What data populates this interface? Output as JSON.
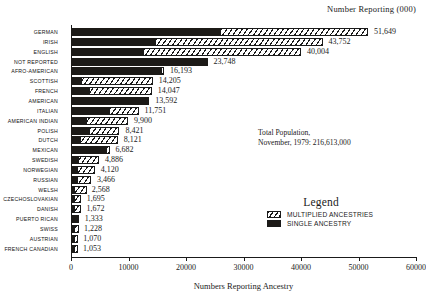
{
  "chart_data": {
    "type": "bar",
    "orientation": "horizontal",
    "stacked": true,
    "title": "Number Reporting (000)",
    "xlabel": "Numbers Reporting Ancestry",
    "ylabel": "",
    "xlim": [
      0,
      60000
    ],
    "xticks": [
      0,
      10000,
      20000,
      30000,
      40000,
      50000,
      60000
    ],
    "xticklabels": [
      "0",
      "10000",
      "20000",
      "30000",
      "40000",
      "50000",
      "60000"
    ],
    "grid": false,
    "legend_position": "lower-right",
    "legend_title": "Legend",
    "annotation": "Total Population,\nNovember, 1979: 216,613,000",
    "annotation_lines": [
      "Total Population,",
      "November, 1979: 216,613,000"
    ],
    "categories": [
      "GERMAN",
      "IRISH",
      "ENGLISH",
      "NOT REPORTED",
      "AFRO-AMERICAN",
      "SCOTTISH",
      "FRENCH",
      "AMERICAN",
      "ITALIAN",
      "AMERICAN INDIAN",
      "POLISH",
      "DUTCH",
      "MEXICAN",
      "SWEDISH",
      "NORWEGIAN",
      "RUSSIAN",
      "WELSH",
      "CZECHOSLOVAKIAN",
      "DANISH",
      "PUERTO RICAN",
      "SWISS",
      "AUSTRIAN",
      "FRENCH CANADIAN"
    ],
    "values": [
      51649,
      43752,
      40004,
      23748,
      16193,
      14205,
      14047,
      13592,
      11751,
      9900,
      8421,
      8121,
      6682,
      4886,
      4120,
      3466,
      2568,
      1695,
      1672,
      1333,
      1228,
      1070,
      1053
    ],
    "value_labels": [
      "51,649",
      "43,752",
      "40,004",
      "23,748",
      "16,193",
      "14,205",
      "14,047",
      "13,592",
      "11,751",
      "9,900",
      "8,421",
      "8,121",
      "6,682",
      "4,886",
      "4,120",
      "3,466",
      "2,568",
      "1,695",
      "1,672",
      "1,333",
      "1,228",
      "1,070",
      "1,053"
    ],
    "series": [
      {
        "name": "SINGLE ANCESTRY",
        "values": [
          25990,
          14600,
          12600,
          23748,
          15600,
          1800,
          3100,
          13592,
          6600,
          2600,
          3200,
          1600,
          6100,
          1300,
          1000,
          1100,
          300,
          450,
          400,
          1333,
          300,
          280,
          300
        ]
      },
      {
        "name": "MULTIPLIED ANCESTRIES",
        "values": [
          25659,
          29152,
          27404,
          0,
          593,
          12405,
          10947,
          0,
          5151,
          7300,
          5221,
          6521,
          582,
          3586,
          3120,
          2366,
          2268,
          1245,
          1272,
          0,
          928,
          790,
          753
        ]
      }
    ],
    "rows": [
      {
        "label": "GERMAN",
        "single": 25990,
        "multi": 25659,
        "total_label": "51,649"
      },
      {
        "label": "IRISH",
        "single": 14600,
        "multi": 29152,
        "total_label": "43,752"
      },
      {
        "label": "ENGLISH",
        "single": 12600,
        "multi": 27404,
        "total_label": "40,004"
      },
      {
        "label": "NOT REPORTED",
        "single": 23748,
        "multi": 0,
        "total_label": "23,748"
      },
      {
        "label": "AFRO-AMERICAN",
        "single": 15600,
        "multi": 593,
        "total_label": "16,193"
      },
      {
        "label": "SCOTTISH",
        "single": 1800,
        "multi": 12405,
        "total_label": "14,205"
      },
      {
        "label": "FRENCH",
        "single": 3100,
        "multi": 10947,
        "total_label": "14,047"
      },
      {
        "label": "AMERICAN",
        "single": 13592,
        "multi": 0,
        "total_label": "13,592"
      },
      {
        "label": "ITALIAN",
        "single": 6600,
        "multi": 5151,
        "total_label": "11,751"
      },
      {
        "label": "AMERICAN INDIAN",
        "single": 2600,
        "multi": 7300,
        "total_label": "9,900"
      },
      {
        "label": "POLISH",
        "single": 3200,
        "multi": 5221,
        "total_label": "8,421"
      },
      {
        "label": "DUTCH",
        "single": 1600,
        "multi": 6521,
        "total_label": "8,121"
      },
      {
        "label": "MEXICAN",
        "single": 6100,
        "multi": 582,
        "total_label": "6,682"
      },
      {
        "label": "SWEDISH",
        "single": 1300,
        "multi": 3586,
        "total_label": "4,886"
      },
      {
        "label": "NORWEGIAN",
        "single": 1000,
        "multi": 3120,
        "total_label": "4,120"
      },
      {
        "label": "RUSSIAN",
        "single": 1100,
        "multi": 2366,
        "total_label": "3,466"
      },
      {
        "label": "WELSH",
        "single": 300,
        "multi": 2268,
        "total_label": "2,568"
      },
      {
        "label": "CZECHOSLOVAKIAN",
        "single": 450,
        "multi": 1245,
        "total_label": "1,695"
      },
      {
        "label": "DANISH",
        "single": 400,
        "multi": 1272,
        "total_label": "1,672"
      },
      {
        "label": "PUERTO RICAN",
        "single": 1333,
        "multi": 0,
        "total_label": "1,333"
      },
      {
        "label": "SWISS",
        "single": 300,
        "multi": 928,
        "total_label": "1,228"
      },
      {
        "label": "AUSTRIAN",
        "single": 280,
        "multi": 790,
        "total_label": "1,070"
      },
      {
        "label": "FRENCH CANADIAN",
        "single": 300,
        "multi": 753,
        "total_label": "1,053"
      }
    ],
    "legend_entries": [
      {
        "label": "MULTIPLIED ANCESTRIES",
        "pattern": "hatched",
        "color": "#1a1a1a"
      },
      {
        "label": "SINGLE ANCESTRY",
        "pattern": "solid",
        "color": "#1c1a17"
      }
    ],
    "colors": {
      "single_ancestry": "#1c1a17",
      "multiplied_ancestries": "#1a1a1a",
      "background": "#ffffff",
      "axis": "#1a1a1a"
    }
  }
}
